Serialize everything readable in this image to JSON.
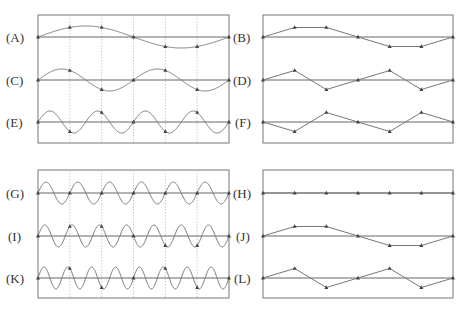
{
  "colors": {
    "frame": "#777777",
    "curve": "#777777",
    "axis": "#555555",
    "guide": "#bbbbbb",
    "dot": "#444444"
  },
  "samples_per_window": 6,
  "groups": [
    {
      "name": "top",
      "box_left": {
        "x": 38,
        "y": 15,
        "w": 191,
        "h": 128
      },
      "box_right": {
        "x": 263,
        "y": 15,
        "w": 190,
        "h": 128
      },
      "show_guides": true,
      "rows": [
        {
          "left_label": "(A)",
          "right_label": "(B)",
          "baseline_y": 37,
          "cycles": 1,
          "amplitude": 11
        },
        {
          "left_label": "(C)",
          "right_label": "(D)",
          "baseline_y": 80,
          "cycles": 2,
          "amplitude": 11
        },
        {
          "left_label": "(E)",
          "right_label": "(F)",
          "baseline_y": 122,
          "cycles": 4,
          "amplitude": 11
        }
      ]
    },
    {
      "name": "bottom",
      "box_left": {
        "x": 38,
        "y": 170,
        "w": 191,
        "h": 128
      },
      "box_right": {
        "x": 263,
        "y": 170,
        "w": 190,
        "h": 128
      },
      "show_guides": true,
      "rows": [
        {
          "left_label": "(G)",
          "right_label": "(H)",
          "baseline_y": 193,
          "cycles": 6,
          "amplitude": 11
        },
        {
          "left_label": "(I)",
          "right_label": "(J)",
          "baseline_y": 236,
          "cycles": 7,
          "amplitude": 11
        },
        {
          "left_label": "(K)",
          "right_label": "(L)",
          "baseline_y": 278,
          "cycles": 8,
          "amplitude": 11
        }
      ]
    }
  ],
  "labels": {
    "A": "(A)",
    "B": "(B)",
    "C": "(C)",
    "D": "(D)",
    "E": "(E)",
    "F": "(F)",
    "G": "(G)",
    "H": "(H)",
    "I": "(I)",
    "J": "(J)",
    "K": "(K)",
    "L": "(L)"
  }
}
